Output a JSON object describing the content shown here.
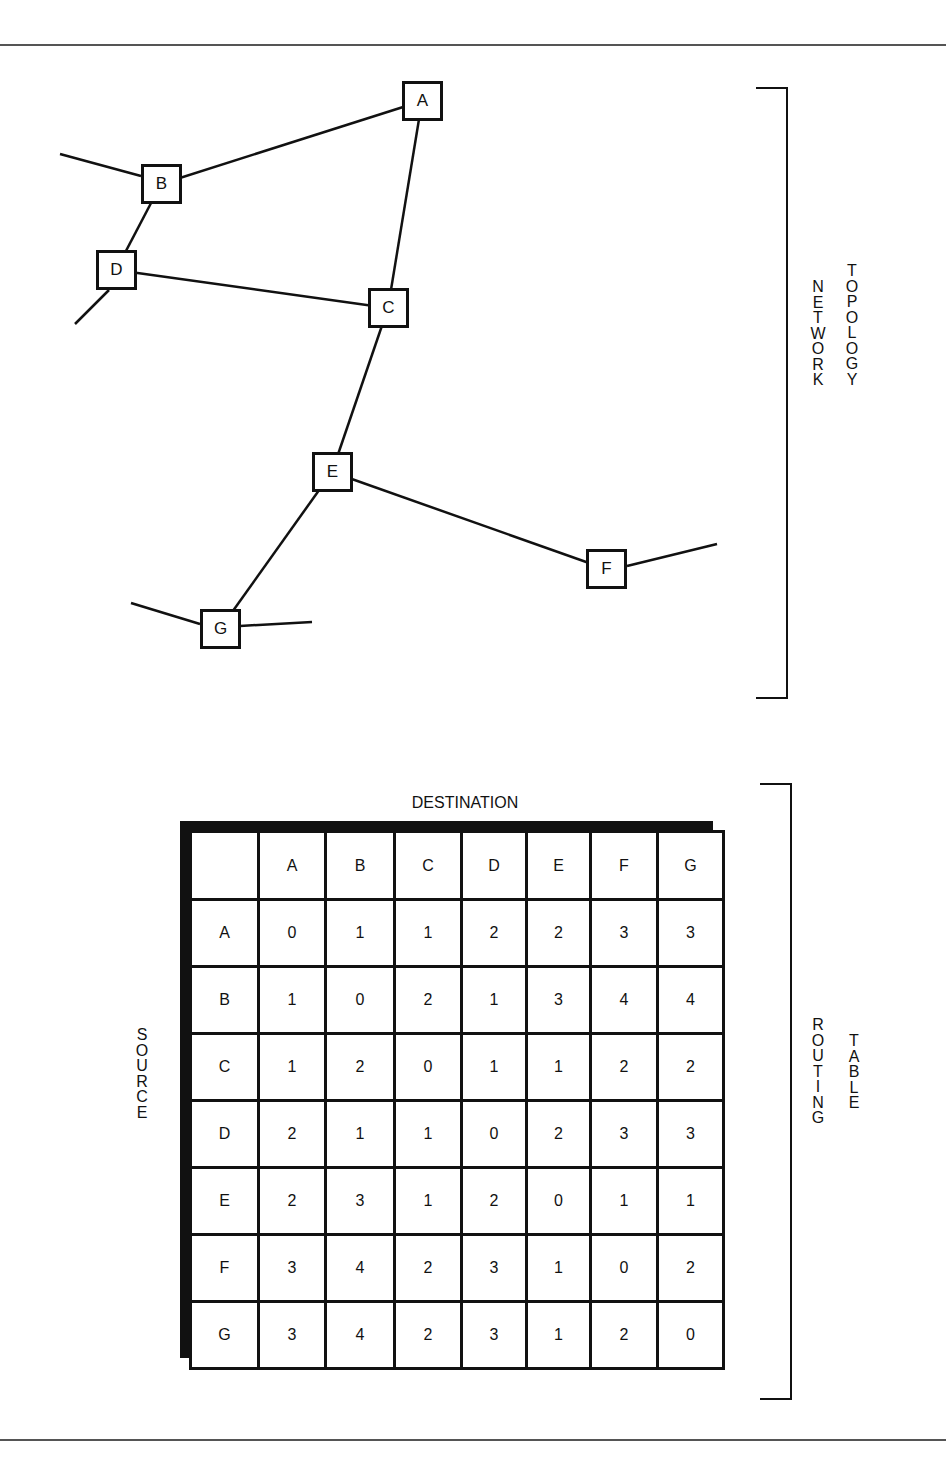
{
  "figure": {
    "topology_label": [
      "NETWORK",
      "TOPOLOGY"
    ],
    "routing_label": [
      "ROUTING",
      "TABLE"
    ],
    "destination_label": "DESTINATION",
    "source_label": "SOURCE"
  },
  "topology": {
    "nodes": [
      {
        "id": "A",
        "label": "A",
        "x": 402,
        "y": 81
      },
      {
        "id": "B",
        "label": "B",
        "x": 141,
        "y": 164
      },
      {
        "id": "C",
        "label": "C",
        "x": 368,
        "y": 288
      },
      {
        "id": "D",
        "label": "D",
        "x": 96,
        "y": 250
      },
      {
        "id": "E",
        "label": "E",
        "x": 312,
        "y": 452
      },
      {
        "id": "F",
        "label": "F",
        "x": 586,
        "y": 549
      },
      {
        "id": "G",
        "label": "G",
        "x": 200,
        "y": 609
      }
    ],
    "links": [
      {
        "from": "A",
        "to": "B"
      },
      {
        "from": "A",
        "to": "C"
      },
      {
        "from": "B",
        "to": "D"
      },
      {
        "from": "D",
        "to": "C"
      },
      {
        "from": "C",
        "to": "E"
      },
      {
        "from": "E",
        "to": "F"
      },
      {
        "from": "E",
        "to": "G"
      }
    ],
    "external_links": [
      {
        "node": "B",
        "x1": 60,
        "y1": 154,
        "x2": 141,
        "y2": 176
      },
      {
        "node": "D",
        "x1": 75,
        "y1": 324,
        "x2": 109,
        "y2": 290
      },
      {
        "node": "F",
        "x1": 627,
        "y1": 566,
        "x2": 717,
        "y2": 544
      },
      {
        "node": "G",
        "x1": 131,
        "y1": 603,
        "x2": 200,
        "y2": 624
      },
      {
        "node": "G",
        "x1": 240,
        "y1": 626,
        "x2": 312,
        "y2": 622
      }
    ]
  },
  "routing_table": {
    "columns": [
      "A",
      "B",
      "C",
      "D",
      "E",
      "F",
      "G"
    ],
    "rows": [
      {
        "source": "A",
        "hops": [
          "0",
          "1",
          "1",
          "2",
          "2",
          "3",
          "3"
        ]
      },
      {
        "source": "B",
        "hops": [
          "1",
          "0",
          "2",
          "1",
          "3",
          "4",
          "4"
        ]
      },
      {
        "source": "C",
        "hops": [
          "1",
          "2",
          "0",
          "1",
          "1",
          "2",
          "2"
        ]
      },
      {
        "source": "D",
        "hops": [
          "2",
          "1",
          "1",
          "0",
          "2",
          "3",
          "3"
        ]
      },
      {
        "source": "E",
        "hops": [
          "2",
          "3",
          "1",
          "2",
          "0",
          "1",
          "1"
        ]
      },
      {
        "source": "F",
        "hops": [
          "3",
          "4",
          "2",
          "3",
          "1",
          "0",
          "2"
        ]
      },
      {
        "source": "G",
        "hops": [
          "3",
          "4",
          "2",
          "3",
          "1",
          "2",
          "0"
        ]
      }
    ]
  }
}
